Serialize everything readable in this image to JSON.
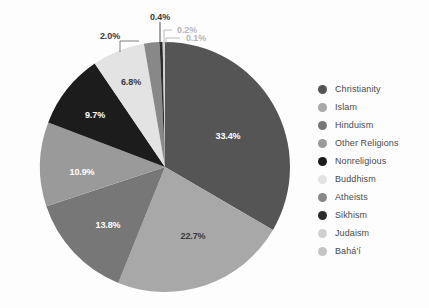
{
  "background_color": "#fdfdfd",
  "legend": {
    "position": "right",
    "items": [
      {
        "label": "Christianity",
        "color": "#555555"
      },
      {
        "label": "Islam",
        "color": "#a8a8a8"
      },
      {
        "label": "Hinduism",
        "color": "#777777"
      },
      {
        "label": "Other Religions",
        "color": "#9a9a9a"
      },
      {
        "label": "Nonreligious",
        "color": "#1c1c1c"
      },
      {
        "label": "Buddhism",
        "color": "#e3e3e3"
      },
      {
        "label": "Atheists",
        "color": "#888888"
      },
      {
        "label": "Sikhism",
        "color": "#2b2b2b"
      },
      {
        "label": "Judaism",
        "color": "#cfcfcf"
      },
      {
        "label": "Bahá'í",
        "color": "#c4c4c4"
      }
    ]
  },
  "chart_data": {
    "type": "pie",
    "title": "",
    "subtitle": "",
    "xlabel": "",
    "ylabel": "",
    "grid": false,
    "legend_position": "right",
    "start_angle_deg": 0,
    "direction": "clockwise",
    "categories": [
      "Christianity",
      "Islam",
      "Hinduism",
      "Other Religions",
      "Nonreligious",
      "Buddhism",
      "Atheists",
      "Sikhism",
      "Judaism",
      "Bahá'í"
    ],
    "values": [
      33.4,
      22.7,
      13.8,
      10.9,
      9.7,
      6.8,
      2.0,
      0.4,
      0.2,
      0.1
    ],
    "colors": [
      "#555555",
      "#a8a8a8",
      "#777777",
      "#9a9a9a",
      "#1c1c1c",
      "#e3e3e3",
      "#888888",
      "#2b2b2b",
      "#cfcfcf",
      "#c4c4c4"
    ],
    "data_labels": [
      "33.4%",
      "22.7%",
      "13.8%",
      "10.9%",
      "9.7%",
      "6.8%",
      "2.0%",
      "0.4%",
      "0.2%",
      "0.1%"
    ],
    "label_units": "percent",
    "total": 100.0
  },
  "labels": {
    "p1": "33.4%",
    "p2": "22.7%",
    "p3": "13.8%",
    "p4": "10.9%",
    "p5": "9.7%",
    "p6": "6.8%",
    "p7": "2.0%",
    "p8": "0.4%",
    "p9": "0.2%",
    "p10": "0.1%"
  }
}
